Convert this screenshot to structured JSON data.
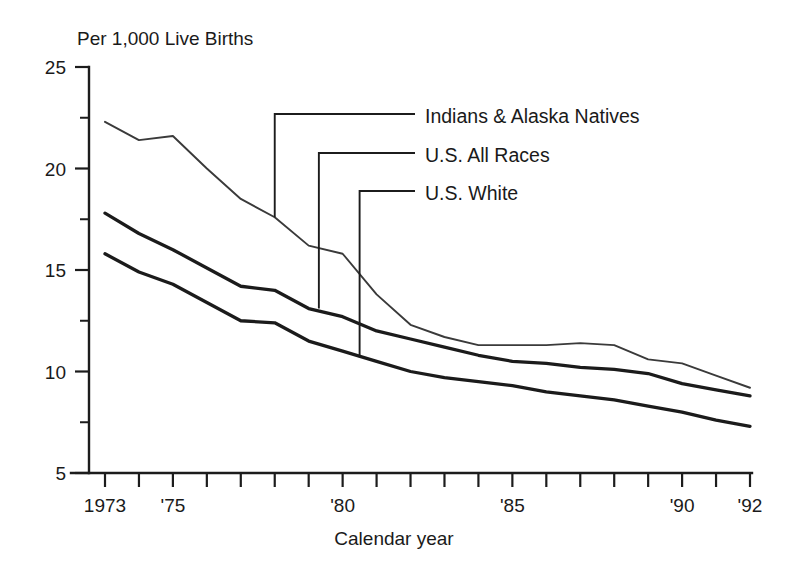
{
  "figure": {
    "unit_title": "Per 1,000 Live Births",
    "x_axis_title": "Calendar year"
  },
  "axes": {
    "y_tick_labels": [
      "25",
      "20",
      "15",
      "10",
      "5"
    ],
    "y_tick_values": [
      25,
      20,
      15,
      10,
      5
    ],
    "y_minor_values": [
      22.5,
      17.5,
      12.5,
      7.5
    ],
    "x_tick_labels": [
      {
        "year": 1973,
        "label": "1973"
      },
      {
        "year": 1975,
        "label": "'75"
      },
      {
        "year": 1980,
        "label": "'80"
      },
      {
        "year": 1985,
        "label": "'85"
      },
      {
        "year": 1990,
        "label": "'90"
      },
      {
        "year": 1992,
        "label": "'92"
      }
    ]
  },
  "legend": {
    "items": [
      {
        "label": "Indians & Alaska Natives",
        "style": "thin"
      },
      {
        "label": "U.S. All Races",
        "style": "thick"
      },
      {
        "label": "U.S. White",
        "style": "thick"
      }
    ]
  },
  "chart_data": {
    "type": "line",
    "title": "",
    "subtitle": "",
    "xlabel": "Calendar year",
    "ylabel": "Per 1,000 Live Births",
    "xlim": [
      1973,
      1992
    ],
    "ylim": [
      5,
      25
    ],
    "grid": false,
    "legend_position": "inside-upper-right",
    "x": [
      1973,
      1974,
      1975,
      1976,
      1977,
      1978,
      1979,
      1980,
      1981,
      1982,
      1983,
      1984,
      1985,
      1986,
      1987,
      1988,
      1989,
      1990,
      1991,
      1992
    ],
    "series": [
      {
        "name": "Indians & Alaska Natives",
        "values": [
          22.3,
          21.4,
          21.6,
          20.0,
          18.5,
          17.6,
          16.2,
          15.8,
          13.8,
          12.3,
          11.7,
          11.3,
          11.3,
          11.3,
          11.4,
          11.3,
          10.6,
          10.4,
          9.8,
          9.2
        ]
      },
      {
        "name": "U.S. All Races",
        "values": [
          17.8,
          16.8,
          16.0,
          15.1,
          14.2,
          14.0,
          13.1,
          12.7,
          12.0,
          11.6,
          11.2,
          10.8,
          10.5,
          10.4,
          10.2,
          10.1,
          9.9,
          9.4,
          9.1,
          8.8
        ]
      },
      {
        "name": "U.S. White",
        "values": [
          15.8,
          14.9,
          14.3,
          13.4,
          12.5,
          12.4,
          11.5,
          11.0,
          10.5,
          10.0,
          9.7,
          9.5,
          9.3,
          9.0,
          8.8,
          8.6,
          8.3,
          8.0,
          7.6,
          7.3
        ]
      }
    ]
  },
  "leaders": [
    {
      "for": "Indians & Alaska Natives",
      "from_year": 1978,
      "from_value": 17.6
    },
    {
      "for": "U.S. All Races",
      "from_year": 1979.3,
      "from_value": 13.1
    },
    {
      "for": "U.S. White",
      "from_year": 1980.5,
      "from_value": 10.7
    }
  ]
}
